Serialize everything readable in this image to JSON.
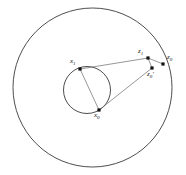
{
  "figure": {
    "background_color": "#ffffff",
    "stroke_color": "#3a3a3a",
    "line_color": "#6a6a6a",
    "point_color": "#111111",
    "width": 186,
    "height": 175,
    "outer_circle": {
      "name": "outer-circle",
      "center_x": 92.5,
      "center_y": 87.5,
      "radius": 79.5
    },
    "inner_circle": {
      "name": "inner-circle",
      "center_x": 87.0,
      "center_y": 90.0,
      "radius": 23.5
    },
    "points": [
      {
        "id": "x1",
        "label_main": "x",
        "label_sub": "1",
        "prime": "",
        "x": 80.0,
        "y": 69.0,
        "label_x": 70.0,
        "label_y": 58.0
      },
      {
        "id": "z1",
        "label_main": "z",
        "label_sub": "1",
        "prime": "",
        "x": 148.0,
        "y": 58.0,
        "label_x": 138.0,
        "label_y": 48.0
      },
      {
        "id": "z0",
        "label_main": "z",
        "label_sub": "0",
        "prime": "",
        "x": 163.0,
        "y": 64.0,
        "label_x": 167.0,
        "label_y": 54.0
      },
      {
        "id": "z0prime",
        "label_main": "z",
        "label_sub": "0",
        "prime": "'",
        "x": 152.0,
        "y": 68.0,
        "label_x": 147.0,
        "label_y": 71.0
      },
      {
        "id": "x0",
        "label_main": "x",
        "label_sub": "0",
        "prime": "",
        "x": 99.0,
        "y": 110.0,
        "label_x": 94.0,
        "label_y": 112.0
      }
    ],
    "segments": [
      {
        "id": "x1-to-z1",
        "from": "x1",
        "to": "z1",
        "x1": 80.0,
        "y1": 69.0,
        "x2": 148.0,
        "y2": 58.0
      },
      {
        "id": "x1-to-x0",
        "from": "x1",
        "to": "x0",
        "x1": 80.0,
        "y1": 69.0,
        "x2": 99.0,
        "y2": 110.0
      },
      {
        "id": "x0-to-z0prime",
        "from": "x0",
        "to": "z0prime",
        "x1": 99.0,
        "y1": 110.0,
        "x2": 152.0,
        "y2": 68.0
      },
      {
        "id": "z1-to-z0prime",
        "from": "z1",
        "to": "z0prime",
        "x1": 148.0,
        "y1": 58.0,
        "x2": 152.0,
        "y2": 68.0
      },
      {
        "id": "z1-to-z0",
        "from": "z1",
        "to": "z0",
        "x1": 148.0,
        "y1": 58.0,
        "x2": 163.0,
        "y2": 64.0
      }
    ]
  }
}
